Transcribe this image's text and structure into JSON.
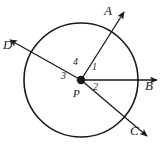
{
  "figure": {
    "type": "geometry-diagram",
    "background_color": "#ffffff",
    "stroke_color": "#1a1a1a"
  },
  "circle": {
    "name": "circle-P",
    "center_x": 81,
    "center_y": 80,
    "radius": 57,
    "stroke_width": 1.6
  },
  "center_point": {
    "label": "P",
    "x": 81,
    "y": 80,
    "dot_radius": 4.2
  },
  "rays": [
    {
      "label": "A",
      "name": "ray-PA",
      "from_x": 81,
      "from_y": 80,
      "to_x": 124,
      "to_y": 12,
      "label_x": 104,
      "label_y": 4
    },
    {
      "label": "B",
      "name": "ray-PB",
      "from_x": 81,
      "from_y": 80,
      "to_x": 158,
      "to_y": 80,
      "label_x": 145,
      "label_y": 86
    },
    {
      "label": "C",
      "name": "ray-PC",
      "from_x": 81,
      "from_y": 80,
      "to_x": 148,
      "to_y": 137,
      "label_x": 131,
      "label_y": 131
    },
    {
      "label": "D",
      "name": "ray-PD",
      "from_x": 81,
      "from_y": 80,
      "to_x": 9,
      "to_y": 39,
      "label_x": 4,
      "label_y": 45
    }
  ],
  "angle_labels": [
    {
      "label": "1",
      "name": "angle-1",
      "x": 93,
      "y": 64
    },
    {
      "label": "2",
      "name": "angle-2",
      "x": 94,
      "y": 83
    },
    {
      "label": "3",
      "name": "angle-3",
      "x": 62,
      "y": 72
    },
    {
      "label": "4",
      "name": "angle-4",
      "x": 74,
      "y": 58
    }
  ]
}
